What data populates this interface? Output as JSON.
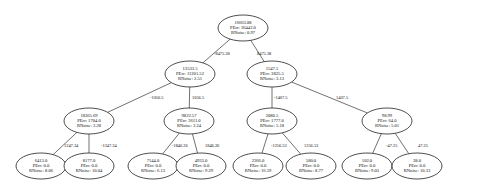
{
  "tree": {
    "node_fields": {
      "error_label": "PErr:",
      "noise_label": "RNoise:"
    },
    "nodes": [
      {
        "id": "n0",
        "value": "16663.88",
        "perr": "36442.0",
        "rnoise": "0.97",
        "cx": 243,
        "cy": 28
      },
      {
        "id": "n1",
        "value": "13533.5",
        "perr": "11201.52",
        "rnoise": "2.51",
        "cx": 190,
        "cy": 74
      },
      {
        "id": "n2",
        "value": "1547.5",
        "perr": "3825.5",
        "rnoise": "3.13",
        "cx": 272,
        "cy": 74
      },
      {
        "id": "n3",
        "value": "18365.69",
        "perr": "1704.0",
        "rnoise": "3.28",
        "cx": 89,
        "cy": 121
      },
      {
        "id": "n4",
        "value": "9822.57",
        "perr": "2611.0",
        "rnoise": "3.24",
        "cx": 189,
        "cy": 121
      },
      {
        "id": "n5",
        "value": "2080.5",
        "perr": "1777.0",
        "rnoise": "5.18",
        "cx": 272,
        "cy": 121
      },
      {
        "id": "n6",
        "value": "98.99",
        "perr": "64.0",
        "rnoise": "5.01",
        "cx": 387,
        "cy": 121
      },
      {
        "id": "n7",
        "value": "6413.0",
        "perr": "0.0",
        "rnoise": "8.06",
        "cx": 41,
        "cy": 166
      },
      {
        "id": "n8",
        "value": "8177.0",
        "perr": "0.0",
        "rnoise": "10.04",
        "cx": 89,
        "cy": 166
      },
      {
        "id": "n9",
        "value": "7144.0",
        "perr": "0.0",
        "rnoise": "6.13",
        "cx": 153,
        "cy": 166
      },
      {
        "id": "n10",
        "value": "4933.0",
        "perr": "0.0",
        "rnoise": "9.29",
        "cx": 201,
        "cy": 166
      },
      {
        "id": "n11",
        "value": "2366.0",
        "perr": "0.0",
        "rnoise": "16.59",
        "cx": 258,
        "cy": 166
      },
      {
        "id": "n12",
        "value": "580.0",
        "perr": "0.0",
        "rnoise": "8.77",
        "cx": 311,
        "cy": 166
      },
      {
        "id": "n13",
        "value": "102.0",
        "perr": "0.0",
        "rnoise": "9.03",
        "cx": 367,
        "cy": 166
      },
      {
        "id": "n14",
        "value": "38.0",
        "perr": "0.0",
        "rnoise": "10.33",
        "cx": 417,
        "cy": 166
      }
    ],
    "edges": [
      {
        "from": "n0",
        "to": "n1",
        "label": "-8475.38",
        "lx": 214,
        "ly": 55
      },
      {
        "from": "n0",
        "to": "n2",
        "label": "8475.38",
        "lx": 257,
        "ly": 55
      },
      {
        "from": "n1",
        "to": "n3",
        "label": "-1056.5",
        "lx": 150,
        "ly": 99
      },
      {
        "from": "n1",
        "to": "n4",
        "label": "1056.5",
        "lx": 192,
        "ly": 99
      },
      {
        "from": "n2",
        "to": "n5",
        "label": "-1407.5",
        "lx": 274,
        "ly": 99
      },
      {
        "from": "n2",
        "to": "n6",
        "label": "1407.5",
        "lx": 336,
        "ly": 99
      },
      {
        "from": "n3",
        "to": "n7",
        "label": "1247.34",
        "lx": 64,
        "ly": 147
      },
      {
        "from": "n3",
        "to": "n8",
        "label": "-1247.34",
        "lx": 101,
        "ly": 147
      },
      {
        "from": "n4",
        "to": "n9",
        "label": "-1846.26",
        "lx": 172,
        "ly": 147
      },
      {
        "from": "n4",
        "to": "n10",
        "label": "1846.26",
        "lx": 205,
        "ly": 147
      },
      {
        "from": "n5",
        "to": "n11",
        "label": "-1256.53",
        "lx": 271,
        "ly": 147
      },
      {
        "from": "n5",
        "to": "n12",
        "label": "1256.53",
        "lx": 304,
        "ly": 147
      },
      {
        "from": "n6",
        "to": "n13",
        "label": "-47.25",
        "lx": 386,
        "ly": 147
      },
      {
        "from": "n6",
        "to": "n14",
        "label": "47.25",
        "lx": 418,
        "ly": 147
      }
    ]
  }
}
